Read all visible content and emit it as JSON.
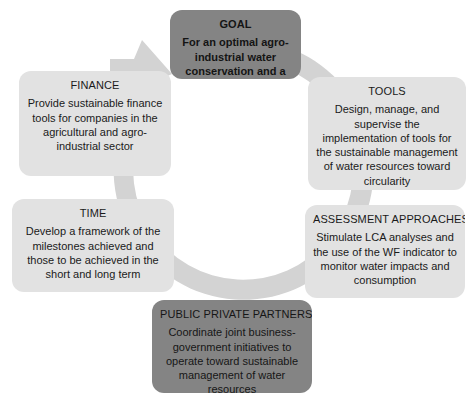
{
  "diagram": {
    "type": "cycle",
    "shape": "circular-arrow",
    "arrow_direction": "clockwise-terminating-at-goal",
    "colors": {
      "cycle_arrow": "#d3d3d3",
      "node_light": "#e2e2e2",
      "node_dark": "#848484",
      "text": "#1a1a1a",
      "background": "#ffffff"
    },
    "nodes": [
      {
        "id": "goal",
        "title": "GOAL",
        "body": "For an optimal agro-industrial water conservation and a reduction in WF",
        "emphasis": "dark",
        "position": "top"
      },
      {
        "id": "tools",
        "title": "TOOLS",
        "body": "Design, manage, and supervise the implementation of tools for the sustainable management of water resources toward circularity",
        "emphasis": "light",
        "position": "upper-right"
      },
      {
        "id": "assessment_approaches",
        "title": "ASSESSMENT APPROACHES",
        "body": "Stimulate LCA analyses and the use of the WF indicator to monitor water impacts and consumption",
        "emphasis": "light",
        "position": "lower-right"
      },
      {
        "id": "public_private_partnerships",
        "title": "PUBLIC PRIVATE PARTNERSHIPS",
        "body": "Coordinate joint business-government initiatives to operate toward sustainable management of water resources",
        "emphasis": "dark",
        "position": "bottom"
      },
      {
        "id": "time",
        "title": "TIME",
        "body": "Develop a framework of the milestones achieved and those to be achieved in the short and long term",
        "emphasis": "light",
        "position": "lower-left"
      },
      {
        "id": "finance",
        "title": "FINANCE",
        "body": "Provide sustainable finance tools for companies in the agricultural and agro-industrial sector",
        "emphasis": "light",
        "position": "upper-left"
      }
    ]
  }
}
